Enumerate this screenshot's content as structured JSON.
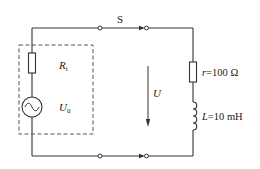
{
  "diagram": {
    "type": "circuit",
    "labels": {
      "switch": "S",
      "internal_resistor": "R",
      "internal_resistor_sub": "i",
      "source": "U",
      "source_sub": "0",
      "voltage": "U",
      "r_symbol": "r",
      "r_value": "=100 Ω",
      "l_symbol": "L",
      "l_value": "=10 mH"
    },
    "components": [
      {
        "id": "Ri",
        "kind": "resistor",
        "label": "Ri"
      },
      {
        "id": "U0",
        "kind": "ac-source",
        "label": "U0"
      },
      {
        "id": "S",
        "kind": "switch",
        "label": "S"
      },
      {
        "id": "r",
        "kind": "resistor",
        "label": "r=100 Ω"
      },
      {
        "id": "L",
        "kind": "inductor",
        "label": "L=10 mH"
      }
    ],
    "colors": {
      "line": "#333333",
      "dash": "#555555"
    }
  }
}
